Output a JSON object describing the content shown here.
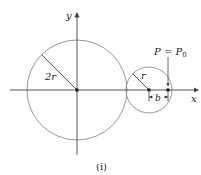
{
  "figure": {
    "caption": "(i)",
    "axes": {
      "x_label": "x",
      "y_label": "y"
    },
    "large_circle": {
      "radius_label": "2r"
    },
    "small_circle": {
      "radius_label": "r"
    },
    "point_label": {
      "lhs": "P",
      "eq": " = ",
      "rhs": "P",
      "sub": "0"
    },
    "distance_label": "b",
    "colors": {
      "circle": "#8a8a8a",
      "axis": "#444444",
      "text": "#222222"
    }
  }
}
